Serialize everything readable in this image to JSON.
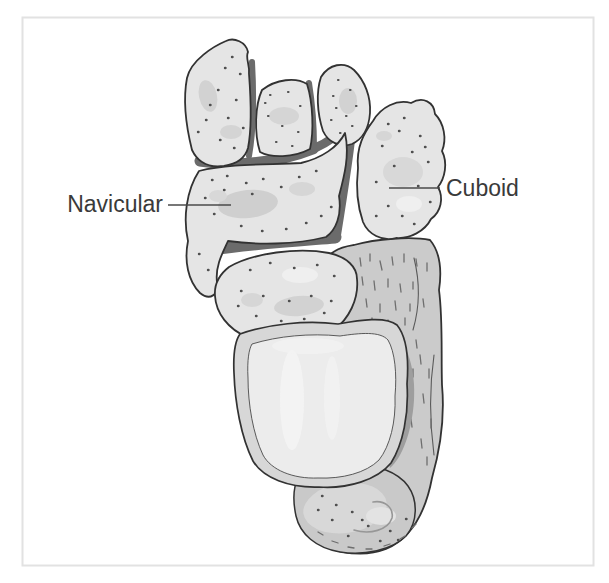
{
  "figure": {
    "labels": {
      "navicular": "Navicular",
      "cuboid": "Cuboid"
    },
    "colors": {
      "background": "#ffffff",
      "frame_border": "#e2e2e2",
      "bone_fill": "#e5e5e5",
      "bone_patch": "#cfcfcf",
      "bone_outline": "#323232",
      "joint_gap": "#6b6b6b",
      "stipple": "#4f4f4f",
      "calcaneus_fill": "#cbcbcb",
      "calcaneus_hatch": "#6e6e6e",
      "trochlea_rim": "#d7d7d7",
      "trochlea_surface": "#ececec",
      "shadow_band": "#9e9e9e",
      "under_band": "#b0b0b0",
      "label_text": "#3a3a3a",
      "leader_line": "#4a4a4a"
    }
  }
}
